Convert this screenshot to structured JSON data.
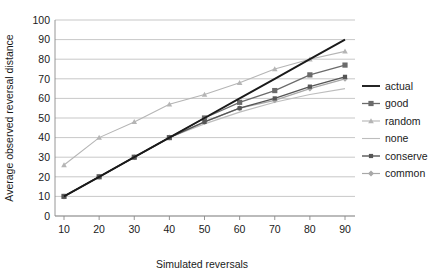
{
  "chart_data": {
    "type": "line",
    "title": "",
    "xlabel": "Simulated reversals",
    "ylabel": "Average observed reversal distance",
    "x": [
      10,
      20,
      30,
      40,
      50,
      60,
      70,
      80,
      90
    ],
    "xlim": [
      0,
      100
    ],
    "ylim": [
      0,
      100
    ],
    "xticks": [
      "10",
      "20",
      "30",
      "40",
      "50",
      "60",
      "70",
      "80",
      "90"
    ],
    "yticks": [
      "0",
      "10",
      "20",
      "30",
      "40",
      "50",
      "60",
      "70",
      "80",
      "90",
      "100"
    ],
    "grid": "horizontal",
    "legend_position": "right",
    "series": [
      {
        "name": "actual",
        "color": "#1a1a1a",
        "marker": "none",
        "width": 1.9,
        "values": [
          10,
          20,
          30,
          40,
          50,
          60,
          70,
          80,
          90
        ]
      },
      {
        "name": "good",
        "color": "#6b6b6b",
        "marker": "square",
        "width": 1.3,
        "values": [
          10,
          20,
          30,
          40,
          50,
          58,
          64,
          72,
          77
        ]
      },
      {
        "name": "random",
        "color": "#b5b5b5",
        "marker": "triangle",
        "width": 1.1,
        "values": [
          26,
          40,
          48,
          57,
          62,
          68,
          75,
          80,
          84
        ]
      },
      {
        "name": "none",
        "color": "#bdbdbd",
        "marker": "none",
        "width": 1.1,
        "values": [
          10,
          20,
          30,
          40,
          47,
          53,
          58,
          62,
          65
        ]
      },
      {
        "name": "conserve",
        "color": "#565656",
        "marker": "square-small",
        "width": 1.4,
        "values": [
          10,
          20,
          30,
          40,
          48,
          55,
          60,
          66,
          71
        ]
      },
      {
        "name": "common",
        "color": "#a8a8a8",
        "marker": "diamond",
        "width": 1.2,
        "values": [
          10,
          20,
          30,
          40,
          48,
          55,
          59,
          65,
          70
        ]
      }
    ]
  },
  "legend": {
    "items": [
      {
        "label": "actual"
      },
      {
        "label": "good"
      },
      {
        "label": "random"
      },
      {
        "label": "none"
      },
      {
        "label": "conserve"
      },
      {
        "label": "common"
      }
    ]
  }
}
